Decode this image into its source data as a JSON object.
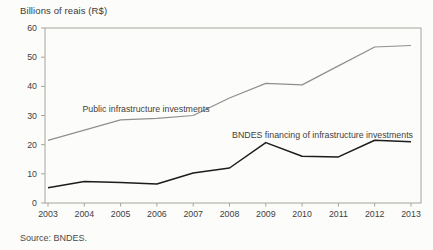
{
  "chart_data": {
    "type": "line",
    "title": "Billions of reais (R$)",
    "xlabel": "",
    "ylabel": "Billions of reais (R$)",
    "source": "Source: BNDES.",
    "categories": [
      "2003",
      "2004",
      "2005",
      "2006",
      "2007",
      "2008",
      "2009",
      "2010",
      "2011",
      "2012",
      "2013"
    ],
    "series": [
      {
        "name": "Public infrastructure investments",
        "color": "#8f8f8f",
        "values": [
          21.5,
          25,
          28.5,
          29,
          30,
          36,
          41,
          40.5,
          47,
          53.5,
          54
        ]
      },
      {
        "name": "BNDES financing of infrastructure investments",
        "color": "#1c1c1c",
        "values": [
          5.2,
          7.4,
          7.0,
          6.5,
          10.3,
          12,
          20.7,
          16,
          15.8,
          21.5,
          21
        ]
      }
    ],
    "ylim": [
      0,
      60
    ],
    "yticks": [
      0,
      10,
      20,
      30,
      40,
      50,
      60
    ],
    "grid": false,
    "legend": "inline-labels",
    "frame_color": "#a8a49c",
    "text_color": "#3f3f3f"
  }
}
